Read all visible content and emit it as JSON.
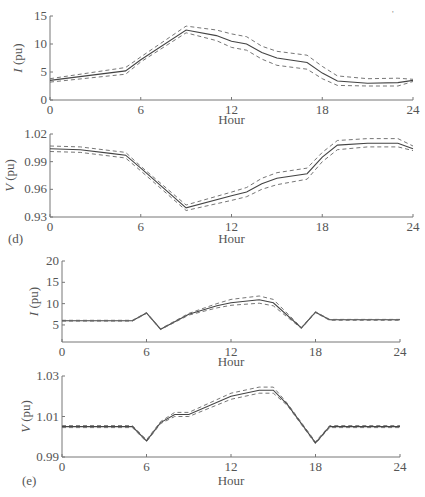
{
  "figure": {
    "panel_labels": [
      "(d)",
      "(e)"
    ],
    "artifact_mark": "'"
  },
  "chart_data": [
    {
      "type": "line",
      "panel": "d-top",
      "title": "",
      "xlabel": "Hour",
      "ylabel": "I (pu)",
      "xlim": [
        0,
        24
      ],
      "ylim": [
        0,
        15
      ],
      "xticks": [
        0,
        6,
        12,
        18,
        24
      ],
      "yticks": [
        0,
        5,
        10,
        15
      ],
      "ytick_labels": [
        "0",
        "5",
        "10",
        "15"
      ],
      "grid": false,
      "x": [
        0,
        5,
        6,
        9,
        11,
        12,
        13,
        14,
        15,
        17,
        18,
        19,
        21,
        23,
        24
      ],
      "series": [
        {
          "name": "mean",
          "style": "solid",
          "values": [
            3.5,
            5.2,
            7.2,
            12.5,
            11.5,
            10.5,
            10.0,
            8.5,
            7.5,
            6.7,
            4.8,
            3.4,
            3.0,
            3.1,
            3.5
          ]
        },
        {
          "name": "upper",
          "style": "dashed",
          "values": [
            3.8,
            5.8,
            7.7,
            13.2,
            12.5,
            11.8,
            11.3,
            9.6,
            8.7,
            8.0,
            6.0,
            4.3,
            3.8,
            3.9,
            3.7
          ]
        },
        {
          "name": "lower",
          "style": "dashed",
          "values": [
            3.2,
            4.6,
            6.8,
            12.0,
            10.6,
            9.4,
            8.9,
            7.3,
            6.2,
            5.5,
            3.8,
            2.6,
            2.5,
            2.5,
            3.3
          ]
        }
      ]
    },
    {
      "type": "line",
      "panel": "d-bottom",
      "title": "",
      "xlabel": "Hour",
      "ylabel": "V (pu)",
      "xlim": [
        0,
        24
      ],
      "ylim": [
        0.93,
        1.02
      ],
      "xticks": [
        0,
        6,
        12,
        18,
        24
      ],
      "yticks": [
        0.93,
        0.96,
        0.99,
        1.02
      ],
      "ytick_labels": [
        "0.93",
        "0.96",
        "0.99",
        "1.02"
      ],
      "grid": false,
      "x": [
        0,
        2,
        4,
        5,
        6,
        9,
        12,
        13,
        14,
        15,
        17,
        18,
        19,
        21,
        23,
        24
      ],
      "series": [
        {
          "name": "mean",
          "style": "solid",
          "values": [
            1.004,
            1.003,
            0.999,
            0.997,
            0.983,
            0.94,
            0.953,
            0.957,
            0.966,
            0.972,
            0.977,
            0.995,
            1.008,
            1.01,
            1.01,
            1.004
          ]
        },
        {
          "name": "upper",
          "style": "dashed",
          "values": [
            1.007,
            1.006,
            1.002,
            1.0,
            0.985,
            0.943,
            0.957,
            0.962,
            0.972,
            0.978,
            0.983,
            1.0,
            1.013,
            1.015,
            1.015,
            1.007
          ]
        },
        {
          "name": "lower",
          "style": "dashed",
          "values": [
            1.001,
            1.0,
            0.996,
            0.994,
            0.98,
            0.937,
            0.948,
            0.952,
            0.96,
            0.965,
            0.971,
            0.99,
            1.003,
            1.006,
            1.006,
            1.002
          ]
        }
      ]
    },
    {
      "type": "line",
      "panel": "e-top",
      "title": "",
      "xlabel": "Hour",
      "ylabel": "I (pu)",
      "xlim": [
        0,
        24
      ],
      "ylim": [
        1,
        20
      ],
      "xticks": [
        0,
        6,
        12,
        18,
        24
      ],
      "yticks": [
        5,
        10,
        15,
        20
      ],
      "ytick_labels": [
        "5",
        "10",
        "15",
        "20"
      ],
      "grid": false,
      "x": [
        0,
        5,
        6,
        7,
        9,
        11,
        12,
        14,
        15,
        17,
        18,
        19,
        24
      ],
      "series": [
        {
          "name": "mean",
          "style": "solid",
          "values": [
            6.0,
            6.0,
            7.8,
            4.0,
            7.5,
            9.5,
            10.2,
            10.9,
            10.2,
            4.3,
            8.0,
            6.2,
            6.2
          ]
        },
        {
          "name": "upper",
          "style": "dashed",
          "values": [
            6.1,
            6.1,
            7.9,
            4.1,
            7.7,
            10.0,
            11.0,
            11.8,
            11.0,
            4.4,
            8.1,
            6.3,
            6.3
          ]
        },
        {
          "name": "lower",
          "style": "dashed",
          "values": [
            5.9,
            5.9,
            7.7,
            3.9,
            7.3,
            9.0,
            9.6,
            10.1,
            9.5,
            4.2,
            7.9,
            6.1,
            6.1
          ]
        }
      ]
    },
    {
      "type": "line",
      "panel": "e-bottom",
      "title": "",
      "xlabel": "Hour",
      "ylabel": "V (pu)",
      "xlim": [
        0,
        24
      ],
      "ylim": [
        0.99,
        1.03
      ],
      "xticks": [
        0,
        6,
        12,
        18,
        24
      ],
      "yticks": [
        0.99,
        1.01,
        1.03
      ],
      "ytick_labels": [
        "0.99",
        "1.01",
        "1.03"
      ],
      "grid": false,
      "x": [
        0,
        5,
        6,
        7,
        8,
        9,
        12,
        14,
        15,
        16,
        18,
        19,
        24
      ],
      "series": [
        {
          "name": "mean",
          "style": "solid",
          "values": [
            1.005,
            1.005,
            0.998,
            1.007,
            1.011,
            1.011,
            1.02,
            1.023,
            1.023,
            1.016,
            0.997,
            1.005,
            1.005
          ]
        },
        {
          "name": "upper",
          "style": "dashed",
          "values": [
            1.0055,
            1.0055,
            0.9985,
            1.0075,
            1.012,
            1.012,
            1.0215,
            1.0245,
            1.0245,
            1.0165,
            0.9975,
            1.0055,
            1.0055
          ]
        },
        {
          "name": "lower",
          "style": "dashed",
          "values": [
            1.0045,
            1.0045,
            0.9975,
            1.0065,
            1.01,
            1.01,
            1.0185,
            1.0215,
            1.0215,
            1.0155,
            0.9965,
            1.0045,
            1.0045
          ]
        }
      ]
    }
  ]
}
